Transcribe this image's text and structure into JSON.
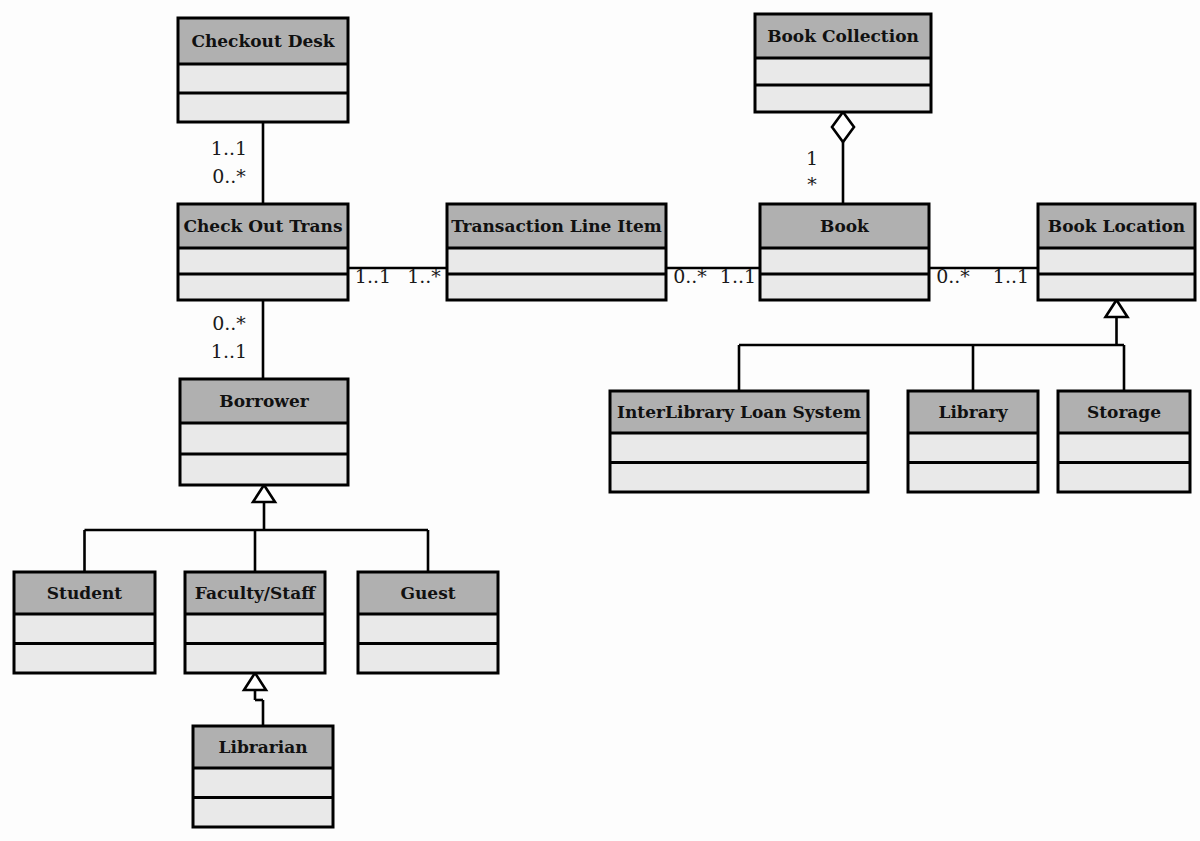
{
  "diagram": {
    "type": "uml-class-diagram",
    "colors": {
      "header_fill": "#b0b0b0",
      "row_fill": "#e9e9e9",
      "border": "#000000",
      "background": "#fdfdfd",
      "text": "#111111"
    },
    "classes": [
      {
        "id": "checkout-desk",
        "name": "Checkout Desk",
        "x": 178,
        "y": 18,
        "width": 170,
        "height": 104,
        "header_height": 46,
        "compartments": 2
      },
      {
        "id": "book-collection",
        "name": "Book Collection",
        "x": 755,
        "y": 14,
        "width": 176,
        "height": 98,
        "header_height": 44,
        "compartments": 2
      },
      {
        "id": "check-out-trans",
        "name": "Check Out Trans",
        "x": 178,
        "y": 204,
        "width": 170,
        "height": 96,
        "header_height": 44,
        "compartments": 2
      },
      {
        "id": "transaction-line-item",
        "name": "Transaction Line Item",
        "x": 447,
        "y": 204,
        "width": 219,
        "height": 96,
        "header_height": 44,
        "compartments": 2
      },
      {
        "id": "book",
        "name": "Book",
        "x": 760,
        "y": 204,
        "width": 169,
        "height": 96,
        "header_height": 44,
        "compartments": 2
      },
      {
        "id": "book-location",
        "name": "Book Location",
        "x": 1038,
        "y": 204,
        "width": 157,
        "height": 96,
        "header_height": 44,
        "compartments": 2
      },
      {
        "id": "borrower",
        "name": "Borrower",
        "x": 180,
        "y": 379,
        "width": 168,
        "height": 106,
        "header_height": 44,
        "compartments": 2
      },
      {
        "id": "interlibrary-loan-system",
        "name": "InterLibrary Loan System",
        "x": 610,
        "y": 391,
        "width": 258,
        "height": 101,
        "header_height": 42,
        "compartments": 2
      },
      {
        "id": "library",
        "name": "Library",
        "x": 908,
        "y": 391,
        "width": 130,
        "height": 101,
        "header_height": 42,
        "compartments": 2
      },
      {
        "id": "storage",
        "name": "Storage",
        "x": 1058,
        "y": 391,
        "width": 132,
        "height": 101,
        "header_height": 42,
        "compartments": 2
      },
      {
        "id": "student",
        "name": "Student",
        "x": 14,
        "y": 572,
        "width": 141,
        "height": 101,
        "header_height": 42,
        "compartments": 2
      },
      {
        "id": "faculty-staff",
        "name": "Faculty/Staff",
        "x": 185,
        "y": 572,
        "width": 140,
        "height": 101,
        "header_height": 42,
        "compartments": 2
      },
      {
        "id": "guest",
        "name": "Guest",
        "x": 358,
        "y": 572,
        "width": 140,
        "height": 101,
        "header_height": 42,
        "compartments": 2
      },
      {
        "id": "librarian",
        "name": "Librarian",
        "x": 193,
        "y": 726,
        "width": 140,
        "height": 101,
        "header_height": 42,
        "compartments": 2
      }
    ],
    "associations": [
      {
        "id": "checkout-desk-check-out-trans",
        "from": "checkout-desk",
        "to": "check-out-trans",
        "kind": "association",
        "from_multiplicity": "1..1",
        "to_multiplicity": "0..*"
      },
      {
        "id": "check-out-trans-transaction-line-item",
        "from": "check-out-trans",
        "to": "transaction-line-item",
        "kind": "association",
        "from_multiplicity": "1..1",
        "to_multiplicity": "1..*"
      },
      {
        "id": "transaction-line-item-book",
        "from": "transaction-line-item",
        "to": "book",
        "kind": "association",
        "from_multiplicity": "0..*",
        "to_multiplicity": "1..1"
      },
      {
        "id": "book-book-location",
        "from": "book",
        "to": "book-location",
        "kind": "association",
        "from_multiplicity": "0..*",
        "to_multiplicity": "1..1"
      },
      {
        "id": "check-out-trans-borrower",
        "from": "check-out-trans",
        "to": "borrower",
        "kind": "association",
        "from_multiplicity": "0..*",
        "to_multiplicity": "1..1"
      },
      {
        "id": "book-collection-book",
        "from": "book-collection",
        "to": "book",
        "kind": "aggregation",
        "from_multiplicity": "1",
        "to_multiplicity": "*"
      }
    ],
    "generalizations": [
      {
        "id": "borrower-subclasses",
        "parent": "borrower",
        "children": [
          "student",
          "faculty-staff",
          "guest"
        ]
      },
      {
        "id": "faculty-staff-subclasses",
        "parent": "faculty-staff",
        "children": [
          "librarian"
        ]
      },
      {
        "id": "book-location-subclasses",
        "parent": "book-location",
        "children": [
          "interlibrary-loan-system",
          "library",
          "storage"
        ]
      }
    ],
    "multiplicity_labels": [
      {
        "id": "m-cd-cot-1",
        "text": "1..1",
        "x": 229,
        "y": 150
      },
      {
        "id": "m-cd-cot-2",
        "text": "0..*",
        "x": 229,
        "y": 178
      },
      {
        "id": "m-cot-tli-1",
        "text": "1..1",
        "x": 373,
        "y": 278
      },
      {
        "id": "m-cot-tli-2",
        "text": "1..*",
        "x": 424,
        "y": 278
      },
      {
        "id": "m-tli-bk-1",
        "text": "0..*",
        "x": 690,
        "y": 278
      },
      {
        "id": "m-tli-bk-2",
        "text": "1..1",
        "x": 738,
        "y": 278
      },
      {
        "id": "m-bk-bl-1",
        "text": "0..*",
        "x": 953,
        "y": 278
      },
      {
        "id": "m-bk-bl-2",
        "text": "1..1",
        "x": 1011,
        "y": 278
      },
      {
        "id": "m-cot-bw-1",
        "text": "0..*",
        "x": 229,
        "y": 325
      },
      {
        "id": "m-cot-bw-2",
        "text": "1..1",
        "x": 229,
        "y": 353
      },
      {
        "id": "m-bc-bk-1",
        "text": "1",
        "x": 812,
        "y": 160
      },
      {
        "id": "m-bc-bk-2",
        "text": "*",
        "x": 812,
        "y": 186
      }
    ]
  }
}
